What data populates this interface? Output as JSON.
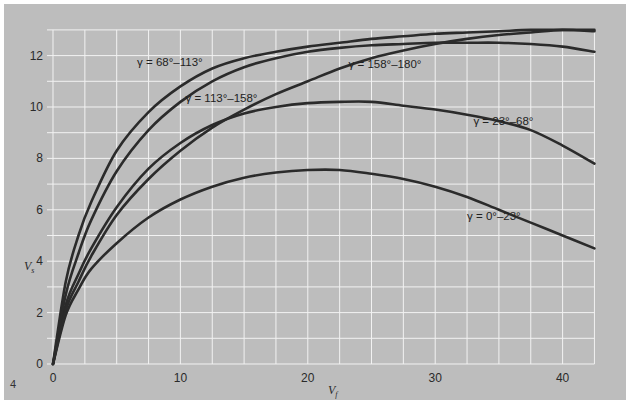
{
  "chart_data": {
    "type": "line",
    "title": "",
    "xlabel": "V_f",
    "ylabel": "V_s",
    "xlabel_main": "V",
    "xlabel_sub": "f",
    "ylabel_main": "V",
    "ylabel_sub": "s",
    "xlim": [
      0,
      42.5
    ],
    "ylim": [
      0,
      13
    ],
    "x_ticks": [
      0,
      10,
      20,
      30,
      40
    ],
    "y_ticks": [
      0,
      2,
      4,
      6,
      8,
      10,
      12
    ],
    "x_grid_step": 2.5,
    "y_grid_step": 1,
    "grid": true,
    "legend": "inline labels",
    "figure_number": "4",
    "colors": {
      "background": "#bdbdbd",
      "grid": "#f2f2f2",
      "line": "#2b2b2b",
      "page": "#ffffff"
    },
    "series": [
      {
        "name": "γ = 0°–23°",
        "x": [
          0,
          1,
          2,
          3,
          5,
          7.5,
          10,
          12.5,
          15,
          17.5,
          20,
          22.5,
          25,
          27.5,
          30,
          32.5,
          35,
          37.5,
          40,
          42.5
        ],
        "y": [
          0,
          1.9,
          2.9,
          3.7,
          4.7,
          5.7,
          6.4,
          6.9,
          7.25,
          7.45,
          7.55,
          7.55,
          7.4,
          7.2,
          6.9,
          6.5,
          6.0,
          5.5,
          5.0,
          4.5
        ],
        "label_pos": [
          32.5,
          5.6
        ]
      },
      {
        "name": "γ = 23°–68°",
        "x": [
          0,
          1,
          2,
          3,
          5,
          7.5,
          10,
          12.5,
          15,
          17.5,
          20,
          22.5,
          25,
          27.5,
          30,
          32.5,
          35,
          37.5,
          40,
          42.5
        ],
        "y": [
          0,
          2.3,
          3.5,
          4.5,
          6.1,
          7.6,
          8.6,
          9.3,
          9.75,
          10.0,
          10.15,
          10.2,
          10.2,
          10.05,
          9.9,
          9.7,
          9.45,
          9.1,
          8.5,
          7.8
        ],
        "label_pos": [
          33,
          9.3
        ]
      },
      {
        "name": "γ = 68°–113°",
        "x": [
          0,
          1,
          2,
          3,
          5,
          7.5,
          10,
          12.5,
          15,
          17.5,
          20,
          22.5,
          25,
          27.5,
          30,
          32.5,
          35,
          37.5,
          40,
          42.5
        ],
        "y": [
          0,
          3.2,
          5.0,
          6.3,
          8.3,
          9.8,
          10.8,
          11.5,
          11.9,
          12.15,
          12.35,
          12.5,
          12.65,
          12.75,
          12.85,
          12.9,
          12.95,
          13.0,
          13.0,
          12.95
        ],
        "label_pos": [
          6.6,
          11.6
        ]
      },
      {
        "name": "γ = 113°–158°",
        "x": [
          0,
          1,
          2,
          3,
          5,
          7.5,
          10,
          12.5,
          15,
          17.5,
          20,
          22.5,
          25,
          27.5,
          30,
          32.5,
          35,
          37.5,
          40,
          42.5
        ],
        "y": [
          0,
          2.7,
          4.3,
          5.6,
          7.5,
          9.1,
          10.2,
          11.0,
          11.55,
          11.9,
          12.15,
          12.3,
          12.4,
          12.45,
          12.5,
          12.5,
          12.5,
          12.45,
          12.35,
          12.15
        ],
        "label_pos": [
          10.4,
          10.2
        ]
      },
      {
        "name": "γ = 158°–180°",
        "x": [
          0,
          1,
          2,
          3,
          5,
          7.5,
          10,
          12.5,
          15,
          17.5,
          20,
          22.5,
          25,
          27.5,
          30,
          32.5,
          35,
          37.5,
          40,
          42.5
        ],
        "y": [
          0,
          2.1,
          3.2,
          4.2,
          5.8,
          7.2,
          8.3,
          9.2,
          9.9,
          10.5,
          11.0,
          11.5,
          11.9,
          12.2,
          12.45,
          12.65,
          12.8,
          12.9,
          13.0,
          13.0
        ],
        "label_pos": [
          23.2,
          11.5
        ]
      }
    ]
  }
}
